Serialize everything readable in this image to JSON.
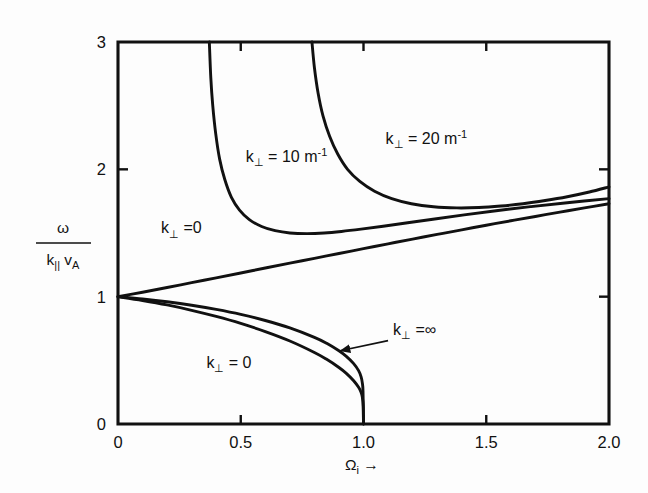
{
  "chart_data": {
    "type": "line",
    "title": "",
    "xlabel": "Ωᵢ →",
    "ylabel_numerator": "ω",
    "ylabel_denominator": "k∥ v_A",
    "xlim": [
      0,
      2.0
    ],
    "ylim": [
      0,
      3
    ],
    "grid": false,
    "legend": "inline-annotations",
    "xticks": [
      {
        "value": 0,
        "label": "0"
      },
      {
        "value": 0.5,
        "label": "0.5"
      },
      {
        "value": 1.0,
        "label": "1.0"
      },
      {
        "value": 1.5,
        "label": "1.5"
      },
      {
        "value": 2.0,
        "label": "2.0"
      }
    ],
    "yticks": [
      {
        "value": 0,
        "label": "0"
      },
      {
        "value": 1,
        "label": "1"
      },
      {
        "value": 2,
        "label": "2"
      },
      {
        "value": 3,
        "label": "3"
      }
    ],
    "series": [
      {
        "name": "k-perp = 0 (fast / upper branch)",
        "label": "k⊥ =0",
        "points": [
          [
            0.0,
            1.0
          ],
          [
            0.1,
            1.035
          ],
          [
            0.2,
            1.072
          ],
          [
            0.3,
            1.11
          ],
          [
            0.4,
            1.148
          ],
          [
            0.5,
            1.186
          ],
          [
            0.6,
            1.225
          ],
          [
            0.7,
            1.263
          ],
          [
            0.8,
            1.301
          ],
          [
            0.9,
            1.339
          ],
          [
            1.0,
            1.377
          ],
          [
            1.1,
            1.415
          ],
          [
            1.2,
            1.452
          ],
          [
            1.3,
            1.489
          ],
          [
            1.4,
            1.525
          ],
          [
            1.5,
            1.561
          ],
          [
            1.6,
            1.596
          ],
          [
            1.7,
            1.63
          ],
          [
            1.8,
            1.664
          ],
          [
            1.9,
            1.697
          ],
          [
            2.0,
            1.73
          ]
        ]
      },
      {
        "name": "k-perp = infinity (descending branch)",
        "label": "k⊥ =∞",
        "points": [
          [
            0.0,
            1.0
          ],
          [
            0.1,
            0.982
          ],
          [
            0.2,
            0.96
          ],
          [
            0.3,
            0.933
          ],
          [
            0.4,
            0.9
          ],
          [
            0.5,
            0.861
          ],
          [
            0.6,
            0.813
          ],
          [
            0.7,
            0.755
          ],
          [
            0.8,
            0.681
          ],
          [
            0.85,
            0.634
          ],
          [
            0.9,
            0.575
          ],
          [
            0.93,
            0.531
          ],
          [
            0.96,
            0.474
          ],
          [
            0.98,
            0.419
          ],
          [
            0.99,
            0.372
          ],
          [
            0.995,
            0.325
          ],
          [
            0.998,
            0.258
          ],
          [
            1.0,
            0.0
          ]
        ]
      },
      {
        "name": "k-perp = 0 (lower / slow branch)",
        "label": "k⊥ = 0",
        "points": [
          [
            0.0,
            1.0
          ],
          [
            0.1,
            0.97
          ],
          [
            0.2,
            0.935
          ],
          [
            0.3,
            0.893
          ],
          [
            0.4,
            0.845
          ],
          [
            0.5,
            0.79
          ],
          [
            0.6,
            0.726
          ],
          [
            0.7,
            0.652
          ],
          [
            0.8,
            0.562
          ],
          [
            0.85,
            0.508
          ],
          [
            0.9,
            0.444
          ],
          [
            0.93,
            0.398
          ],
          [
            0.96,
            0.34
          ],
          [
            0.98,
            0.288
          ],
          [
            0.99,
            0.25
          ],
          [
            0.995,
            0.214
          ],
          [
            0.999,
            0.14
          ],
          [
            1.0,
            0.0
          ]
        ]
      },
      {
        "name": "k-perp = 10 m^-1",
        "label": "k⊥ = 10 m⁻¹",
        "points": [
          [
            0.372,
            3.0
          ],
          [
            0.378,
            2.72
          ],
          [
            0.386,
            2.5
          ],
          [
            0.398,
            2.28
          ],
          [
            0.414,
            2.08
          ],
          [
            0.435,
            1.92
          ],
          [
            0.462,
            1.78
          ],
          [
            0.495,
            1.68
          ],
          [
            0.535,
            1.605
          ],
          [
            0.585,
            1.551
          ],
          [
            0.64,
            1.518
          ],
          [
            0.7,
            1.5
          ],
          [
            0.77,
            1.495
          ],
          [
            0.84,
            1.5
          ],
          [
            0.91,
            1.512
          ],
          [
            0.99,
            1.53
          ],
          [
            1.08,
            1.553
          ],
          [
            1.18,
            1.58
          ],
          [
            1.29,
            1.61
          ],
          [
            1.41,
            1.642
          ],
          [
            1.54,
            1.675
          ],
          [
            1.68,
            1.707
          ],
          [
            1.83,
            1.738
          ],
          [
            2.0,
            1.77
          ]
        ]
      },
      {
        "name": "k-perp = 20 m^-1",
        "label": "k⊥ = 20 m⁻¹",
        "points": [
          [
            0.79,
            3.0
          ],
          [
            0.8,
            2.8
          ],
          [
            0.815,
            2.6
          ],
          [
            0.835,
            2.42
          ],
          [
            0.862,
            2.26
          ],
          [
            0.895,
            2.12
          ],
          [
            0.935,
            2.0
          ],
          [
            0.985,
            1.905
          ],
          [
            1.045,
            1.828
          ],
          [
            1.115,
            1.77
          ],
          [
            1.195,
            1.73
          ],
          [
            1.285,
            1.706
          ],
          [
            1.38,
            1.697
          ],
          [
            1.47,
            1.7
          ],
          [
            1.56,
            1.712
          ],
          [
            1.65,
            1.73
          ],
          [
            1.74,
            1.755
          ],
          [
            1.83,
            1.785
          ],
          [
            1.92,
            1.822
          ],
          [
            2.0,
            1.862
          ]
        ]
      }
    ],
    "annotations": [
      {
        "id": "k10-label",
        "text_main": "k",
        "sub": "⊥",
        "rest": " = 10 m",
        "sup": "-1",
        "x": 0.52,
        "y": 2.06
      },
      {
        "id": "k20-label",
        "text_main": "k",
        "sub": "⊥",
        "rest": " = 20 m",
        "sup": "-1",
        "x": 1.09,
        "y": 2.2
      },
      {
        "id": "kperp-zero-upper",
        "text_main": "k",
        "sub": "⊥",
        "rest": " =0",
        "sup": "",
        "x": 0.175,
        "y": 1.5
      },
      {
        "id": "kperp-zero-lower",
        "text_main": "k",
        "sub": "⊥",
        "rest": " = 0",
        "sup": "",
        "x": 0.36,
        "y": 0.44
      },
      {
        "id": "kperp-infinity",
        "text_main": "k",
        "sub": "⊥",
        "rest": " =∞",
        "sup": "",
        "x": 1.12,
        "y": 0.7
      }
    ],
    "leader_arrow": {
      "from_x": 1.1,
      "from_y": 0.655,
      "to_x": 0.905,
      "to_y": 0.575
    }
  },
  "figure": {
    "caption": ""
  }
}
